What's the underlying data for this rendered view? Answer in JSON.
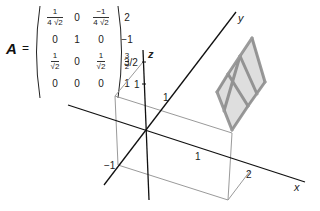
{
  "matrix": {
    "name": "A",
    "equals": "=",
    "rows": [
      [
        {
          "num": "1",
          "den": "4 √2"
        },
        "0",
        {
          "num": "−1",
          "den": "4 √2"
        },
        "2"
      ],
      [
        "0",
        "1",
        "0",
        "−1"
      ],
      [
        {
          "num": "1",
          "den": "√2"
        },
        "0",
        {
          "num": "1",
          "den": "√2"
        },
        {
          "num": "3",
          "den": "2"
        }
      ],
      [
        "0",
        "0",
        "0",
        "1"
      ]
    ]
  },
  "axes": {
    "x_label": "x",
    "y_label": "y",
    "z_label": "z",
    "x_ticks": [
      "1",
      "2"
    ],
    "y_ticks": [
      "−1",
      "1"
    ],
    "z_ticks": [
      "1",
      "3/2"
    ]
  },
  "shape": {
    "description": "transformed unit grid parallelogram",
    "color": "#8a8a8a"
  },
  "colors": {
    "axis": "#111111",
    "box": "#9a9a9a",
    "shape_fill": "#c8c8c8",
    "shape_edge": "#7a7a7a"
  }
}
